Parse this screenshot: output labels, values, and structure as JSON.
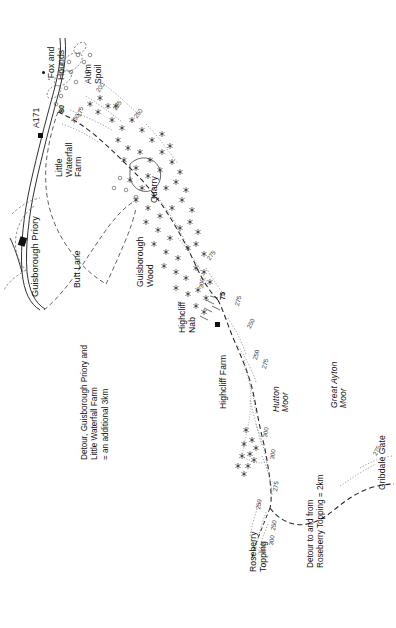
{
  "map": {
    "title": "Cleveland Way walking route map — Guisborough to Gribdale Gate",
    "orientation_note": "text rotated 90 degrees (reads bottom-to-top)",
    "background_color": "#ffffff",
    "ink_color": "#1a1a1a",
    "contour_color": "#3a3a3a"
  },
  "places": [
    {
      "id": "fox-and-hounds",
      "label": "'Fox and\nHounds'",
      "x": 47,
      "y": 80
    },
    {
      "id": "alum-spoil",
      "label": "Alum\nSpoil",
      "x": 84,
      "y": 84
    },
    {
      "id": "a171",
      "label": "A171",
      "x": 32,
      "y": 128
    },
    {
      "id": "little-waterfall-farm",
      "label": "Little\nWaterfall\nFarm",
      "x": 55,
      "y": 177
    },
    {
      "id": "quarry",
      "label": "Quarry",
      "x": 150,
      "y": 203
    },
    {
      "id": "guisborough-priory",
      "label": "Guisborough Priory",
      "x": 30,
      "y": 297
    },
    {
      "id": "butt-lane",
      "label": "Butt Lane",
      "x": 73,
      "y": 288
    },
    {
      "id": "guisborough-wood",
      "label": "Guisborough\nWood",
      "x": 136,
      "y": 287
    },
    {
      "id": "highcliff-nab",
      "label": "Highcliff\nNab",
      "x": 178,
      "y": 333
    },
    {
      "id": "highcliff-farm",
      "label": "Highcliff Farm",
      "x": 219,
      "y": 409
    },
    {
      "id": "hutton-moor",
      "label": "Hutton\nMoor",
      "x": 272,
      "y": 412,
      "italic": true
    },
    {
      "id": "great-ayton-moor",
      "label": "Great Ayton\nMoor",
      "x": 330,
      "y": 408,
      "italic": true
    },
    {
      "id": "gribdale-gate",
      "label": "Gribdale Gate",
      "x": 378,
      "y": 490
    },
    {
      "id": "roseberry-topping",
      "label": "Roseberry\nTopping",
      "x": 249,
      "y": 572
    }
  ],
  "notes": [
    {
      "id": "detour-guisborough",
      "label": "Detour, Guisborough Priory and\nLittle Waterfall Farm\n= an additional 3km",
      "x": 80,
      "y": 460
    },
    {
      "id": "detour-roseberry",
      "label": "Detour to and from\nRoseberry Topping = 2km",
      "x": 306,
      "y": 568
    }
  ],
  "spot_heights": [
    {
      "id": "spot-80",
      "label": "80",
      "x": 58,
      "y": 113
    },
    {
      "id": "spot-75",
      "label": "75",
      "x": 219,
      "y": 300
    }
  ],
  "contours": [
    {
      "label": "200",
      "x": 95,
      "y": 90
    },
    {
      "label": "225",
      "x": 112,
      "y": 108
    },
    {
      "label": "150",
      "x": 70,
      "y": 121
    },
    {
      "label": "175",
      "x": 76,
      "y": 116
    },
    {
      "label": "250",
      "x": 133,
      "y": 116
    },
    {
      "label": "275",
      "x": 206,
      "y": 258
    },
    {
      "label": "300",
      "x": 198,
      "y": 288
    },
    {
      "label": "275",
      "x": 234,
      "y": 305
    },
    {
      "label": "250",
      "x": 246,
      "y": 327
    },
    {
      "label": "250",
      "x": 252,
      "y": 359
    },
    {
      "label": "275",
      "x": 261,
      "y": 368
    },
    {
      "label": "300",
      "x": 262,
      "y": 437
    },
    {
      "label": "300",
      "x": 269,
      "y": 459
    },
    {
      "label": "275",
      "x": 272,
      "y": 491
    },
    {
      "label": "250",
      "x": 255,
      "y": 509
    },
    {
      "label": "250",
      "x": 270,
      "y": 530
    },
    {
      "label": "300",
      "x": 268,
      "y": 545
    },
    {
      "label": "320",
      "x": 259,
      "y": 553
    },
    {
      "label": "275",
      "x": 372,
      "y": 454
    }
  ],
  "legend_symbols": [
    {
      "id": "building-marker",
      "name": "black-square-building"
    },
    {
      "id": "woodland-marker",
      "name": "tree-symbol"
    },
    {
      "id": "route-line",
      "name": "dashed-route-path"
    },
    {
      "id": "road-line",
      "name": "double-line-road"
    }
  ]
}
